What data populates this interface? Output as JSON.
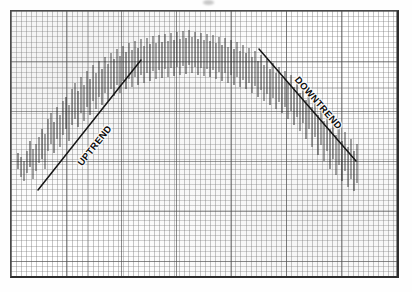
{
  "figure": {
    "background_color": "#ffffff",
    "frame_color": "#4a4a4a",
    "ink_color": "#2b2b2b",
    "frame": {
      "x": 10,
      "y": 10,
      "width": 389,
      "height": 268
    }
  },
  "annotations": {
    "uptrend_label": "UPTREND",
    "downtrend_label": "DOWNTREND"
  },
  "artifacts": {
    "top_smudge_label": "scan-smudge"
  },
  "chart_data": {
    "type": "bar",
    "subtype": "ohlc-high-low-bars",
    "title": "",
    "subtitle": "",
    "xlabel": "",
    "ylabel": "",
    "xlim": [
      0,
      100
    ],
    "ylim": [
      0,
      100
    ],
    "grid": true,
    "grid_minor_spacing_px": 5,
    "grid_major_spacing_px": {
      "x": 55,
      "y": 50
    },
    "legend": null,
    "axis_tick_labels": {
      "x": [],
      "y": []
    },
    "bars": [
      {
        "x": 17,
        "low": 168,
        "high": 152
      },
      {
        "x": 20,
        "low": 176,
        "high": 156
      },
      {
        "x": 23,
        "low": 180,
        "high": 160
      },
      {
        "x": 26,
        "low": 172,
        "high": 150
      },
      {
        "x": 29,
        "low": 166,
        "high": 140
      },
      {
        "x": 32,
        "low": 178,
        "high": 148
      },
      {
        "x": 35,
        "low": 170,
        "high": 143
      },
      {
        "x": 38,
        "low": 162,
        "high": 136
      },
      {
        "x": 41,
        "low": 158,
        "high": 128
      },
      {
        "x": 44,
        "low": 168,
        "high": 133
      },
      {
        "x": 47,
        "low": 150,
        "high": 118
      },
      {
        "x": 50,
        "low": 143,
        "high": 112
      },
      {
        "x": 53,
        "low": 152,
        "high": 121
      },
      {
        "x": 56,
        "low": 138,
        "high": 106
      },
      {
        "x": 59,
        "low": 146,
        "high": 114
      },
      {
        "x": 62,
        "low": 134,
        "high": 100
      },
      {
        "x": 65,
        "low": 128,
        "high": 96
      },
      {
        "x": 68,
        "low": 140,
        "high": 104
      },
      {
        "x": 71,
        "low": 124,
        "high": 88
      },
      {
        "x": 74,
        "low": 118,
        "high": 82
      },
      {
        "x": 77,
        "low": 126,
        "high": 90
      },
      {
        "x": 80,
        "low": 112,
        "high": 76
      },
      {
        "x": 83,
        "low": 120,
        "high": 84
      },
      {
        "x": 86,
        "low": 106,
        "high": 70
      },
      {
        "x": 89,
        "low": 114,
        "high": 78
      },
      {
        "x": 92,
        "low": 100,
        "high": 64
      },
      {
        "x": 95,
        "low": 108,
        "high": 72
      },
      {
        "x": 98,
        "low": 96,
        "high": 60
      },
      {
        "x": 101,
        "low": 104,
        "high": 68
      },
      {
        "x": 104,
        "low": 92,
        "high": 56
      },
      {
        "x": 107,
        "low": 100,
        "high": 63
      },
      {
        "x": 110,
        "low": 88,
        "high": 52
      },
      {
        "x": 113,
        "low": 95,
        "high": 58
      },
      {
        "x": 116,
        "low": 84,
        "high": 48
      },
      {
        "x": 119,
        "low": 92,
        "high": 55
      },
      {
        "x": 122,
        "low": 80,
        "high": 45
      },
      {
        "x": 125,
        "low": 88,
        "high": 51
      },
      {
        "x": 128,
        "low": 78,
        "high": 42
      },
      {
        "x": 131,
        "low": 86,
        "high": 49
      },
      {
        "x": 134,
        "low": 76,
        "high": 40
      },
      {
        "x": 137,
        "low": 84,
        "high": 47
      },
      {
        "x": 140,
        "low": 74,
        "high": 38
      },
      {
        "x": 143,
        "low": 82,
        "high": 45
      },
      {
        "x": 146,
        "low": 72,
        "high": 37
      },
      {
        "x": 149,
        "low": 80,
        "high": 43
      },
      {
        "x": 152,
        "low": 70,
        "high": 35
      },
      {
        "x": 155,
        "low": 78,
        "high": 42
      },
      {
        "x": 158,
        "low": 69,
        "high": 34
      },
      {
        "x": 161,
        "low": 77,
        "high": 41
      },
      {
        "x": 164,
        "low": 68,
        "high": 33
      },
      {
        "x": 167,
        "low": 76,
        "high": 40
      },
      {
        "x": 170,
        "low": 67,
        "high": 32
      },
      {
        "x": 173,
        "low": 75,
        "high": 39
      },
      {
        "x": 176,
        "low": 66,
        "high": 31
      },
      {
        "x": 179,
        "low": 74,
        "high": 38
      },
      {
        "x": 182,
        "low": 65,
        "high": 30
      },
      {
        "x": 185,
        "low": 73,
        "high": 37
      },
      {
        "x": 188,
        "low": 64,
        "high": 29
      },
      {
        "x": 191,
        "low": 72,
        "high": 36
      },
      {
        "x": 194,
        "low": 66,
        "high": 31
      },
      {
        "x": 197,
        "low": 74,
        "high": 38
      },
      {
        "x": 200,
        "low": 67,
        "high": 32
      },
      {
        "x": 203,
        "low": 75,
        "high": 39
      },
      {
        "x": 206,
        "low": 68,
        "high": 33
      },
      {
        "x": 209,
        "low": 76,
        "high": 40
      },
      {
        "x": 212,
        "low": 69,
        "high": 34
      },
      {
        "x": 215,
        "low": 78,
        "high": 42
      },
      {
        "x": 218,
        "low": 71,
        "high": 36
      },
      {
        "x": 221,
        "low": 80,
        "high": 44
      },
      {
        "x": 224,
        "low": 72,
        "high": 37
      },
      {
        "x": 227,
        "low": 82,
        "high": 46
      },
      {
        "x": 230,
        "low": 74,
        "high": 39
      },
      {
        "x": 233,
        "low": 84,
        "high": 48
      },
      {
        "x": 236,
        "low": 76,
        "high": 41
      },
      {
        "x": 239,
        "low": 86,
        "high": 50
      },
      {
        "x": 242,
        "low": 79,
        "high": 44
      },
      {
        "x": 245,
        "low": 88,
        "high": 52
      },
      {
        "x": 248,
        "low": 82,
        "high": 47
      },
      {
        "x": 251,
        "low": 92,
        "high": 56
      },
      {
        "x": 254,
        "low": 85,
        "high": 50
      },
      {
        "x": 257,
        "low": 96,
        "high": 60
      },
      {
        "x": 260,
        "low": 89,
        "high": 54
      },
      {
        "x": 263,
        "low": 100,
        "high": 64
      },
      {
        "x": 266,
        "low": 93,
        "high": 58
      },
      {
        "x": 269,
        "low": 104,
        "high": 68
      },
      {
        "x": 272,
        "low": 97,
        "high": 62
      },
      {
        "x": 275,
        "low": 108,
        "high": 72
      },
      {
        "x": 278,
        "low": 101,
        "high": 66
      },
      {
        "x": 281,
        "low": 112,
        "high": 76
      },
      {
        "x": 284,
        "low": 106,
        "high": 70
      },
      {
        "x": 287,
        "low": 118,
        "high": 82
      },
      {
        "x": 290,
        "low": 110,
        "high": 74
      },
      {
        "x": 293,
        "low": 124,
        "high": 86
      },
      {
        "x": 296,
        "low": 116,
        "high": 79
      },
      {
        "x": 299,
        "low": 130,
        "high": 92
      },
      {
        "x": 302,
        "low": 122,
        "high": 84
      },
      {
        "x": 305,
        "low": 138,
        "high": 99
      },
      {
        "x": 308,
        "low": 128,
        "high": 90
      },
      {
        "x": 311,
        "low": 146,
        "high": 106
      },
      {
        "x": 314,
        "low": 136,
        "high": 97
      },
      {
        "x": 317,
        "low": 154,
        "high": 114
      },
      {
        "x": 320,
        "low": 144,
        "high": 104
      },
      {
        "x": 323,
        "low": 160,
        "high": 120
      },
      {
        "x": 326,
        "low": 150,
        "high": 110
      },
      {
        "x": 329,
        "low": 168,
        "high": 128
      },
      {
        "x": 332,
        "low": 158,
        "high": 118
      },
      {
        "x": 335,
        "low": 174,
        "high": 134
      },
      {
        "x": 338,
        "low": 164,
        "high": 124
      },
      {
        "x": 341,
        "low": 180,
        "high": 140
      },
      {
        "x": 344,
        "low": 170,
        "high": 131
      },
      {
        "x": 347,
        "low": 186,
        "high": 146
      },
      {
        "x": 350,
        "low": 178,
        "high": 138
      },
      {
        "x": 353,
        "low": 190,
        "high": 150
      },
      {
        "x": 356,
        "low": 182,
        "high": 143
      }
    ],
    "trendlines": [
      {
        "name": "UPTREND",
        "direction": "up",
        "x1": 37,
        "y1": 189,
        "x2": 140,
        "y2": 59
      },
      {
        "name": "DOWNTREND",
        "direction": "down",
        "x1": 258,
        "y1": 48,
        "x2": 355,
        "y2": 160
      }
    ]
  }
}
